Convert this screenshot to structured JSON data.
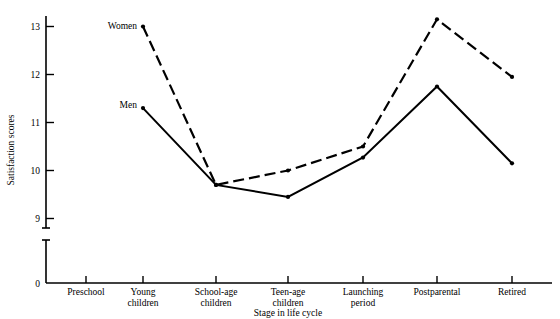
{
  "chart_data": {
    "type": "line",
    "title": "",
    "xlabel": "Stage in life cycle",
    "ylabel": "Satisfaction scores",
    "categories": [
      "Preschool",
      "Young children",
      "School-age children",
      "Teen-age children",
      "Launching period",
      "Postparental",
      "Retired"
    ],
    "ytick_labels": [
      "0",
      "9",
      "10",
      "11",
      "12",
      "13"
    ],
    "ylim": [
      9,
      13.4
    ],
    "y_axis_break": true,
    "grid": false,
    "legend_position": "inline-annotation",
    "series": [
      {
        "name": "Women",
        "style": "dashed",
        "values": [
          null,
          13.0,
          9.7,
          10.0,
          10.5,
          13.15,
          11.95
        ]
      },
      {
        "name": "Men",
        "style": "solid",
        "values": [
          null,
          11.3,
          9.7,
          9.45,
          10.27,
          11.75,
          10.15
        ]
      }
    ],
    "annotations": [
      {
        "text": "Women",
        "at_category": "Young children",
        "value": 13.0
      },
      {
        "text": "Men",
        "at_category": "Young children",
        "value": 11.3
      }
    ]
  },
  "axis": {
    "y_label_text": "Satisfaction scores",
    "x_label_text": "Stage in life cycle",
    "y_ticks": [
      {
        "label": "13",
        "value": 13
      },
      {
        "label": "12",
        "value": 12
      },
      {
        "label": "11",
        "value": 11
      },
      {
        "label": "10",
        "value": 10
      },
      {
        "label": "9",
        "value": 9
      },
      {
        "label": "0",
        "value": 0
      }
    ],
    "x_ticks": [
      {
        "line1": "Preschool",
        "line2": ""
      },
      {
        "line1": "Young",
        "line2": "children"
      },
      {
        "line1": "School-age",
        "line2": "children"
      },
      {
        "line1": "Teen-age",
        "line2": "children"
      },
      {
        "line1": "Launching",
        "line2": "period"
      },
      {
        "line1": "Postparental",
        "line2": ""
      },
      {
        "line1": "Retired",
        "line2": ""
      }
    ]
  },
  "colors": {
    "ink": "#000000",
    "background": "#ffffff"
  }
}
